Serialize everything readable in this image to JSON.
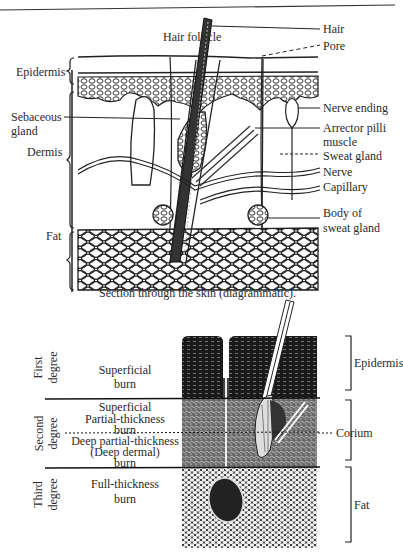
{
  "figure1": {
    "caption": "Section through the skin (diagrammatic).",
    "labels_left": {
      "epidermis": "Epidermis",
      "sebaceous_gland_1": "Sebaceous",
      "sebaceous_gland_2": "gland",
      "dermis": "Dermis",
      "fat": "Fat"
    },
    "label_top": "Hair follicle",
    "labels_right": {
      "hair": "Hair",
      "pore": "Pore",
      "nerve_ending": "Nerve ending",
      "arrector_1": "Arrector pilli",
      "arrector_2": "muscle",
      "sweat_gland": "Sweat gland",
      "nerve": "Nerve",
      "capillary": "Capillary",
      "body_sweat_1": "Body of",
      "body_sweat_2": "sweat gland"
    }
  },
  "figure2": {
    "degrees": {
      "first_1": "First",
      "first_2": "degree",
      "second_1": "Second",
      "second_2": "degree",
      "third_1": "Third",
      "third_2": "degree"
    },
    "burns": {
      "superficial_1": "Superficial",
      "superficial_2": "burn",
      "sp_1": "Superficial",
      "sp_2": "Partial-thickness",
      "sp_3": "burn",
      "dp_1": "Deep partial-thickness",
      "dp_2": "(Deep dermal)",
      "dp_3": "burn",
      "full_1": "Full-thickness",
      "full_2": "burn"
    },
    "layers": {
      "epidermis": "Epidermis",
      "corium": "Corium",
      "fat": "Fat"
    }
  }
}
